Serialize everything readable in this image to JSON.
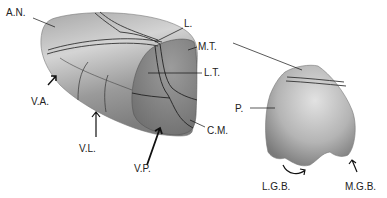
{
  "diagram": {
    "type": "anatomical illustration",
    "labels": {
      "an": "A.N.",
      "l": "L.",
      "mt": "M.T.",
      "lt": "L.T.",
      "va": "V.A.",
      "vl": "V.L.",
      "vp": "V.P.",
      "cm": "C.M.",
      "p": "P.",
      "lgb": "L.G.B.",
      "mgb": "M.G.B."
    }
  }
}
